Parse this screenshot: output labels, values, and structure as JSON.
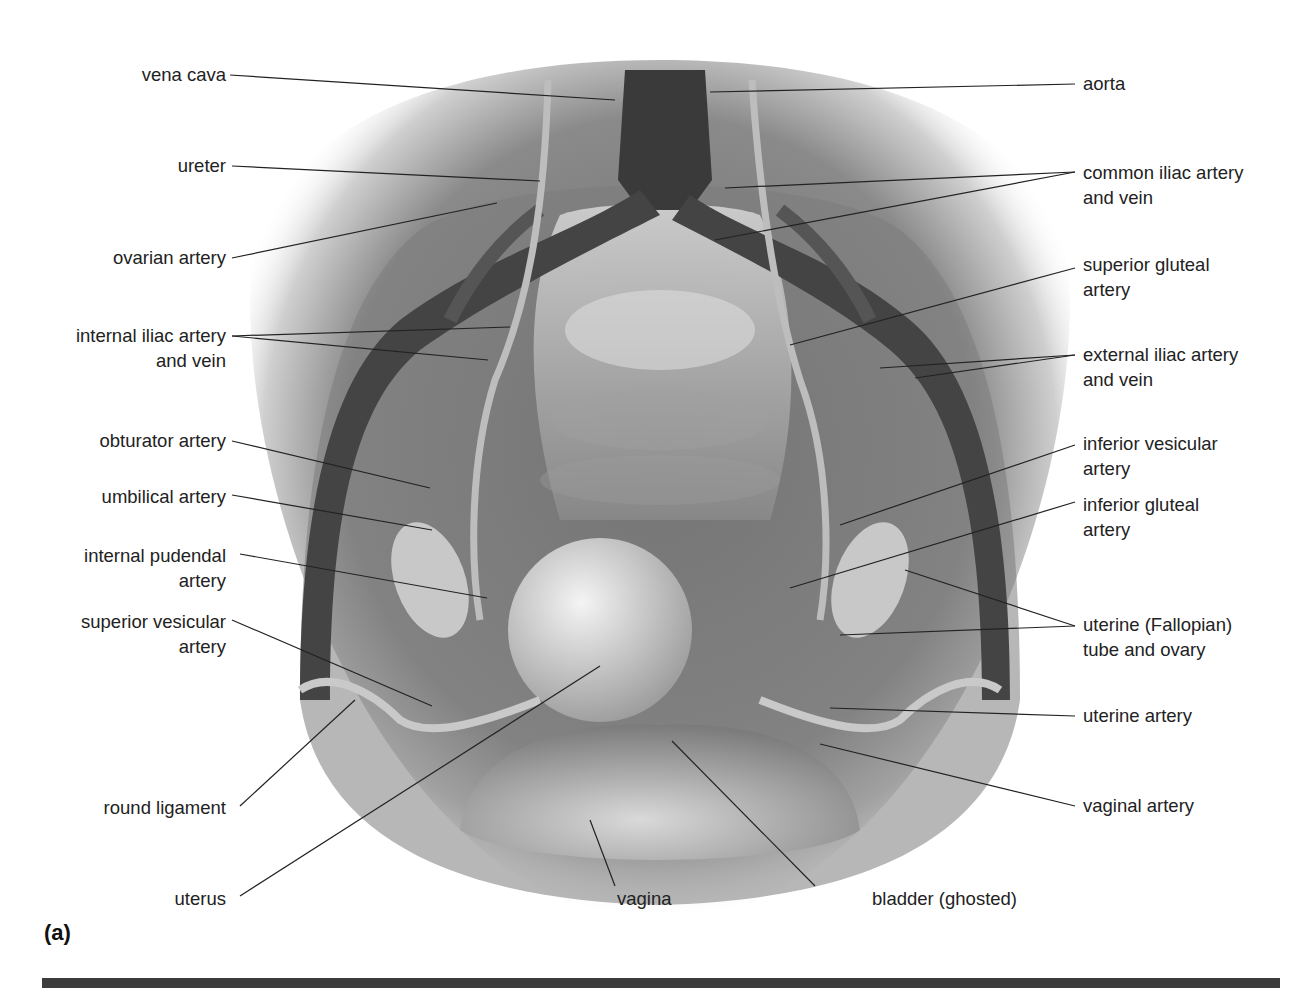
{
  "figure": {
    "panel_label": "(a)",
    "background": "#ffffff",
    "rule_color": "#3c3c3c",
    "labels_left": [
      {
        "id": "vena-cava",
        "lines": [
          "vena cava"
        ]
      },
      {
        "id": "ureter",
        "lines": [
          "ureter"
        ]
      },
      {
        "id": "ovarian-artery",
        "lines": [
          "ovarian artery"
        ]
      },
      {
        "id": "internal-iliac",
        "lines": [
          "internal iliac artery",
          "and vein"
        ]
      },
      {
        "id": "obturator-artery",
        "lines": [
          "obturator artery"
        ]
      },
      {
        "id": "umbilical-artery",
        "lines": [
          "umbilical artery"
        ]
      },
      {
        "id": "internal-pudendal",
        "lines": [
          "internal pudendal",
          "artery"
        ]
      },
      {
        "id": "superior-vesicular",
        "lines": [
          "superior vesicular",
          "artery"
        ]
      },
      {
        "id": "round-ligament",
        "lines": [
          "round ligament"
        ]
      },
      {
        "id": "uterus",
        "lines": [
          "uterus"
        ]
      }
    ],
    "labels_right": [
      {
        "id": "aorta",
        "lines": [
          "aorta"
        ]
      },
      {
        "id": "common-iliac",
        "lines": [
          "common iliac artery",
          "and vein"
        ]
      },
      {
        "id": "superior-gluteal",
        "lines": [
          "superior gluteal",
          "artery"
        ]
      },
      {
        "id": "external-iliac",
        "lines": [
          "external iliac artery",
          "and vein"
        ]
      },
      {
        "id": "inferior-vesicular",
        "lines": [
          "inferior vesicular",
          "artery"
        ]
      },
      {
        "id": "inferior-gluteal",
        "lines": [
          "inferior gluteal",
          "artery"
        ]
      },
      {
        "id": "uterine-tube-ovary",
        "lines": [
          "uterine (Fallopian)",
          "tube and ovary"
        ]
      },
      {
        "id": "uterine-artery",
        "lines": [
          "uterine artery"
        ]
      },
      {
        "id": "vaginal-artery",
        "lines": [
          "vaginal artery"
        ]
      }
    ],
    "labels_bottom": [
      {
        "id": "vagina",
        "lines": [
          "vagina"
        ]
      },
      {
        "id": "bladder",
        "lines": [
          "bladder (ghosted)"
        ]
      }
    ]
  }
}
